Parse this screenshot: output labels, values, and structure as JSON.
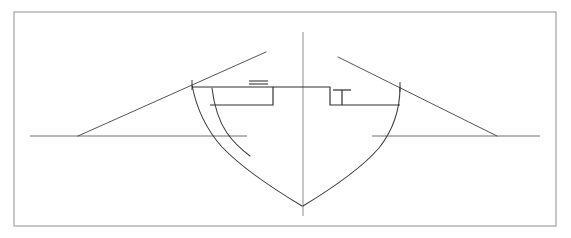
{
  "document": {
    "title": "Ship Midship Body Plan Section",
    "kind": "technical-line-drawing",
    "width": 571,
    "height": 238,
    "background_color": "#ffffff"
  },
  "colors": {
    "frame": "#9a9a9a",
    "hull": "#3a3a3a",
    "deck": "#2e2e2e",
    "construction": "#4a4a4a",
    "centerline": "#8e8e8e",
    "waterline": "#6f6f6f"
  },
  "frame": {
    "x": 14,
    "y": 12,
    "width": 542,
    "height": 214
  },
  "geometry": {
    "centerline": {
      "label": "vertical centreline",
      "x": 303,
      "y_top": 32,
      "y_bottom": 216
    },
    "waterline_left": {
      "label": "left base waterline",
      "x1": 30,
      "x2": 247,
      "y": 136
    },
    "waterline_right": {
      "label": "right base waterline",
      "x1": 372,
      "x2": 540,
      "y": 136
    },
    "diagonal_left": {
      "label": "left construction diagonal",
      "x1": 78,
      "y1": 136,
      "x2": 266,
      "y2": 52
    },
    "diagonal_right": {
      "label": "right construction diagonal",
      "x1": 338,
      "y1": 57,
      "x2": 497,
      "y2": 136
    },
    "hull_outer_left": {
      "label": "left outer hull station curve",
      "path": "M 192 85 C 196 106, 205 128, 222 147 C 242 168, 272 188, 302 206"
    },
    "hull_outer_right": {
      "label": "right outer hull station curve",
      "path": "M 400 87 C 400 107, 394 129, 379 148 C 360 170, 331 189, 303 206"
    },
    "hull_inner_left": {
      "label": "left inner bilge / station line",
      "path": "M 212 88 C 214 105, 218 120, 227 133 C 234 143, 242 150, 250 156"
    },
    "tick_left": {
      "label": "left sheer tick mark",
      "x": 192,
      "y1": 80,
      "y2": 90
    },
    "tick_right": {
      "label": "right sheer tick mark",
      "x": 400,
      "y1": 82,
      "y2": 92
    },
    "deck_profile": {
      "label": "stepped deck and bulwark profile",
      "sheer_y": 87,
      "deck_y": 105,
      "left_start_x": 192,
      "left_step_x": 273,
      "right_step_x": 330,
      "right_end_x": 400,
      "path": "M 192 87 L 273 87 L 273 105 L 192 105",
      "path_center": "M 273 87 L 330 87 L 330 105 L 400 105",
      "path_left_deck": "M 210 105 L 273 105"
    },
    "mast": {
      "label": "T-shaped mast / post",
      "stem_x": 342,
      "stem_y_top": 90,
      "stem_y_bottom": 105,
      "cross_y": 90,
      "cross_x1": 333,
      "cross_x2": 351
    },
    "deck_marker": {
      "label": "short double-dash deck marker",
      "x1": 249,
      "x2": 268,
      "y_upper": 81,
      "y_lower": 84
    }
  }
}
